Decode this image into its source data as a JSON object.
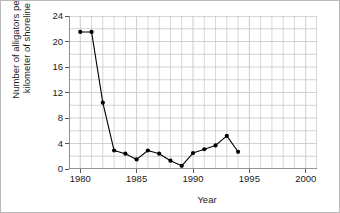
{
  "chart_data": {
    "type": "line",
    "title": "",
    "xlabel": "Year",
    "ylabel": "Number of alligators per\nkilometer of shoreline",
    "xlim": [
      1979,
      2001
    ],
    "ylim": [
      0,
      24
    ],
    "xticks": [
      1980,
      1985,
      1990,
      1995,
      2000
    ],
    "yticks": [
      0,
      4,
      8,
      12,
      16,
      20,
      24
    ],
    "xtick_labels": [
      "1980",
      "1985",
      "1990",
      "1995",
      "2000"
    ],
    "ytick_labels": [
      "0",
      "4",
      "8",
      "12",
      "16",
      "20",
      "24"
    ],
    "x_minor_step": 1,
    "y_minor_step": 2,
    "grid": true,
    "legend": "none",
    "marker": "filled-circle",
    "series": [
      {
        "name": "Alligators per kilometer of shoreline",
        "color": "#000000",
        "x": [
          1980,
          1981,
          1982,
          1983,
          1984,
          1985,
          1986,
          1987,
          1988,
          1989,
          1990,
          1991,
          1992,
          1993,
          1994
        ],
        "values": [
          21.5,
          21.5,
          10.4,
          2.9,
          2.4,
          1.5,
          2.9,
          2.4,
          1.3,
          0.5,
          2.5,
          3.1,
          3.7,
          5.2,
          2.7
        ]
      }
    ]
  },
  "style": {
    "grid_color": "#c6c6c6",
    "axis_color": "#555555",
    "line_color": "#000000",
    "marker_color": "#000000",
    "text_color": "#1a1a1a",
    "background": "#ffffff",
    "border_color": "#b9b9b9"
  }
}
